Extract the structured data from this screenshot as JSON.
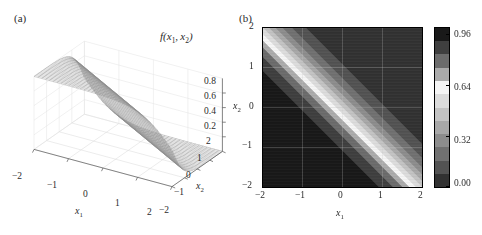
{
  "figure": {
    "panel_a": {
      "label": "(a)",
      "function_label": "f(x₁, x₂)",
      "axes": {
        "x1": {
          "title": "x₁",
          "ticks": [
            "-2",
            "-1",
            "0",
            "1",
            "2"
          ],
          "range": [
            -2,
            2
          ]
        },
        "x2": {
          "title": "x₂",
          "ticks": [
            "2",
            "1",
            "0",
            "-1",
            "-2"
          ],
          "range": [
            -2,
            2
          ]
        },
        "z": {
          "title": "f(x₁, x₂)",
          "ticks": [
            "0.2",
            "0.4",
            "0.6",
            "0.8"
          ],
          "range": [
            0,
            1
          ]
        }
      },
      "plot_type": "3d-wireframe-mesh"
    },
    "panel_b": {
      "label": "(b)",
      "axes": {
        "x1": {
          "title": "x₁",
          "ticks": [
            "-2",
            "-1",
            "0",
            "1",
            "2"
          ],
          "range": [
            -2,
            2
          ]
        },
        "x2": {
          "title": "x₂",
          "ticks": [
            "-2",
            "-1",
            "0",
            "1",
            "2"
          ],
          "range": [
            -2,
            2
          ]
        }
      },
      "colorbar": {
        "ticks": [
          "0.96",
          "0.64",
          "0.32",
          "0.00"
        ],
        "tick_values": [
          0.96,
          0.64,
          0.32,
          0.0
        ],
        "min": 0.0,
        "max": 1.0,
        "bands": 12,
        "orientation": "vertical"
      },
      "plot_type": "grayscale-density"
    }
  },
  "chart_data": [
    {
      "type": "line",
      "subtype": "surface-3d-wireframe",
      "title": "(a)",
      "xlabel": "x₁",
      "ylabel": "x₂",
      "zlabel": "f(x₁, x₂)",
      "xlim": [
        -2,
        2
      ],
      "ylim": [
        -2,
        2
      ],
      "zlim": [
        0,
        1
      ],
      "xticks": [
        -2,
        -1,
        0,
        1,
        2
      ],
      "yticks": [
        -2,
        -1,
        0,
        1,
        2
      ],
      "zticks": [
        0.2,
        0.4,
        0.6,
        0.8
      ],
      "grid": true,
      "legend": "none",
      "mesh_n": 36,
      "description": "Sigmoid-like ridge surface; value rises from ~0 at large x1+x2 to ~1 at small x1+x2, smooth monotone transition across the anti-diagonal."
    },
    {
      "type": "heatmap",
      "title": "(b)",
      "xlabel": "x₁",
      "ylabel": "x₂",
      "xlim": [
        -2,
        2
      ],
      "ylim": [
        -2,
        2
      ],
      "xticks": [
        -2,
        -1,
        0,
        1,
        2
      ],
      "yticks": [
        -2,
        -1,
        0,
        1,
        2
      ],
      "grid": true,
      "colormap": "grayscale-discrete",
      "cbar_ticks": [
        0.0,
        0.32,
        0.64,
        0.96
      ],
      "cbar_min": 0.0,
      "cbar_max": 1.0,
      "cbar_bands": 12,
      "legend": "colorbar-right",
      "description": "Bright anti-diagonal band along x1 + x2 = 0; dark upper-right region (high value wrapping to dark) and medium-dark lower-left region."
    }
  ]
}
